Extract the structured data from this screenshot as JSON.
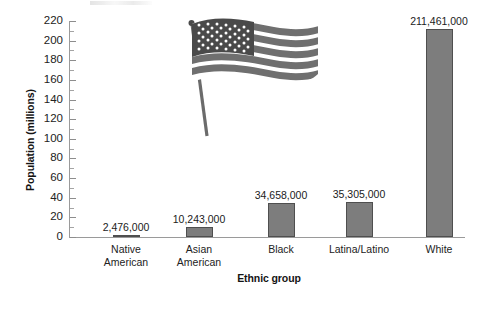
{
  "chart_data": {
    "type": "bar",
    "title": "",
    "xlabel": "Ethnic group",
    "ylabel": "Population (millions)",
    "categories": [
      "Native American",
      "Asian American",
      "Black",
      "Latina/Latino",
      "White"
    ],
    "category_lines": [
      [
        "Native",
        "American"
      ],
      [
        "Asian",
        "American"
      ],
      [
        "Black"
      ],
      [
        "Latina/Latino"
      ],
      [
        "White"
      ]
    ],
    "values": [
      2.476,
      10.243,
      34.658,
      35.305,
      211.461
    ],
    "value_labels": [
      "2,476,000",
      "10,243,000",
      "34,658,000",
      "35,305,000",
      "211,461,000"
    ],
    "ylim": [
      0,
      220
    ],
    "ytick_step": 20,
    "yticks": [
      0,
      20,
      40,
      60,
      80,
      100,
      120,
      140,
      160,
      180,
      200,
      220
    ],
    "ytick_labels": [
      "0",
      "20",
      "40",
      "60",
      "80",
      "100",
      "120",
      "140",
      "160",
      "180",
      "200",
      "220"
    ],
    "minor_ticks": true,
    "grid": false,
    "legend": null,
    "units": "millions",
    "bar_color": "#7d7d7d",
    "bar_edge_color": "#4f4f4f",
    "axis_color": "#9a9a9a",
    "text_color": "#1b1b1b"
  },
  "decoration": {
    "flag_icon_name": "usa-flag-illustration",
    "flag_stripe_color": "#6f6f6f",
    "flag_canton_color": "#4a4a4a",
    "flag_star_color": "#ffffff",
    "flag_pole_color": "#6b6b6b"
  }
}
